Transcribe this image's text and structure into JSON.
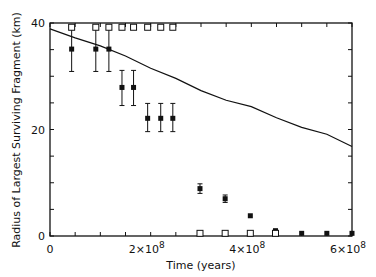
{
  "chart_data": {
    "type": "scatter",
    "title": "",
    "xlabel": "Time (years)",
    "ylabel": "Radius of Largest Surviving Fragment (km)",
    "xlim": [
      0,
      600000000
    ],
    "ylim": [
      0,
      40
    ],
    "x_ticks": [
      {
        "value": 0,
        "label": "0"
      },
      {
        "value": 200000000,
        "label": "2×10",
        "exp": "8"
      },
      {
        "value": 400000000,
        "label": "4×10",
        "exp": "8"
      },
      {
        "value": 600000000,
        "label": "6×10",
        "exp": "8"
      }
    ],
    "y_ticks": [
      {
        "value": 0,
        "label": "0"
      },
      {
        "value": 20,
        "label": "20"
      },
      {
        "value": 40,
        "label": "40"
      }
    ],
    "grid": false,
    "legend": null,
    "series": [
      {
        "name": "curve",
        "style": "line",
        "x": [
          0,
          50000000,
          100000000,
          150000000,
          200000000,
          250000000,
          300000000,
          350000000,
          400000000,
          450000000,
          500000000,
          550000000,
          600000000
        ],
        "values": [
          38.9,
          37.2,
          35.7,
          33.8,
          31.5,
          29.6,
          27.3,
          25.5,
          24.3,
          22.2,
          20.4,
          19.1,
          16.8
        ]
      },
      {
        "name": "open squares",
        "style": "open-square",
        "x": [
          43000000,
          91000000,
          117000000,
          143000000,
          166000000,
          194000000,
          220000000,
          244000000,
          298000000,
          348000000,
          398000000,
          448000000
        ],
        "values": [
          39.2,
          39.2,
          39.2,
          39.2,
          39.2,
          39.2,
          39.2,
          39.2,
          0.5,
          0.5,
          0.5,
          0.5
        ]
      },
      {
        "name": "filled points with error bars",
        "style": "filled-square-errorbar",
        "x": [
          43000000,
          91000000,
          117000000,
          143000000,
          166000000,
          194000000,
          220000000,
          244000000,
          298000000,
          348000000,
          398000000,
          448000000,
          500000000,
          550000000,
          600000000
        ],
        "values": [
          35.1,
          35.1,
          35.1,
          27.9,
          27.9,
          22.1,
          22.1,
          22.1,
          8.9,
          7.0,
          3.8,
          1.0,
          0.5,
          0.5,
          0.5
        ],
        "err_low": [
          30.9,
          30.9,
          30.9,
          24.5,
          24.5,
          19.6,
          19.6,
          19.6,
          8.0,
          6.3,
          3.8,
          1.0,
          0.5,
          0.5,
          0.5
        ],
        "err_high": [
          38.9,
          38.9,
          38.9,
          31.1,
          31.1,
          24.9,
          24.9,
          24.9,
          9.8,
          7.7,
          3.8,
          1.0,
          0.5,
          0.5,
          0.5
        ]
      }
    ]
  }
}
